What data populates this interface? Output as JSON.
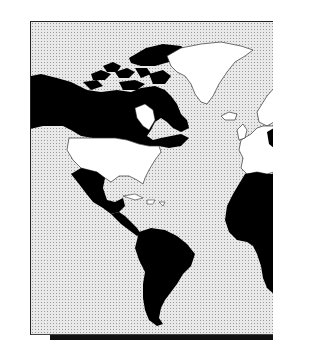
{
  "map": {
    "title": "World map (Americas, Atlantic, West Africa, Europe)",
    "colors": {
      "ocean": "#e9e9e9",
      "highlighted_land": "#000000",
      "other_land": "#ffffff",
      "outline": "#333333",
      "frame": "#222222"
    },
    "regions": [
      {
        "name": "Alaska and Canada",
        "fill": "black"
      },
      {
        "name": "Canadian Arctic Archipelago",
        "fill": "black"
      },
      {
        "name": "Greenland",
        "fill": "white"
      },
      {
        "name": "Iceland",
        "fill": "white"
      },
      {
        "name": "United States",
        "fill": "white"
      },
      {
        "name": "Mexico",
        "fill": "black"
      },
      {
        "name": "Central America",
        "fill": "black"
      },
      {
        "name": "Caribbean islands",
        "fill": "white"
      },
      {
        "name": "South America",
        "fill": "black"
      },
      {
        "name": "Europe",
        "fill": "white"
      },
      {
        "name": "Africa",
        "fill": "black"
      },
      {
        "name": "Scandinavia / northern Europe",
        "fill": "black-partial"
      }
    ]
  }
}
